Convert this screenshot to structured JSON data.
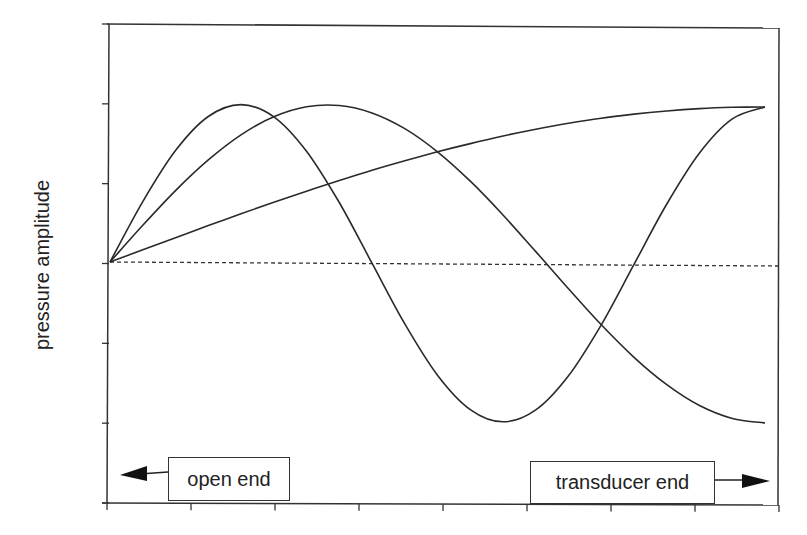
{
  "chart_data": {
    "type": "line",
    "title": "",
    "xlabel": "",
    "ylabel": "pressure amplitude",
    "xlim": [
      0,
      1
    ],
    "ylim": [
      -1.5,
      1.5
    ],
    "grid": false,
    "legend": null,
    "x_ticks_count": 9,
    "y_ticks_count": 7,
    "zero_line": {
      "y": 0,
      "style": "dotted"
    },
    "x": [
      0,
      0.05,
      0.1,
      0.15,
      0.2,
      0.25,
      0.3,
      0.35,
      0.4,
      0.45,
      0.5,
      0.55,
      0.6,
      0.65,
      0.7,
      0.75,
      0.8,
      0.85,
      0.9,
      0.95,
      1.0
    ],
    "series": [
      {
        "name": "quarter-wave mode",
        "values": [
          0,
          0.078,
          0.156,
          0.233,
          0.309,
          0.383,
          0.454,
          0.522,
          0.588,
          0.649,
          0.707,
          0.76,
          0.809,
          0.853,
          0.891,
          0.924,
          0.951,
          0.972,
          0.988,
          0.997,
          1.0
        ]
      },
      {
        "name": "three-quarter-wave mode",
        "values": [
          0,
          0.233,
          0.454,
          0.649,
          0.809,
          0.924,
          0.988,
          0.997,
          0.951,
          0.853,
          0.707,
          0.522,
          0.309,
          0.078,
          -0.156,
          -0.383,
          -0.588,
          -0.76,
          -0.891,
          -0.972,
          -1.0
        ]
      },
      {
        "name": "five-quarter-wave mode",
        "values": [
          0,
          0.383,
          0.707,
          0.924,
          1.0,
          0.924,
          0.707,
          0.383,
          0,
          -0.383,
          -0.707,
          -0.924,
          -1.0,
          -0.924,
          -0.707,
          -0.383,
          0,
          0.383,
          0.707,
          0.924,
          1.0
        ]
      }
    ],
    "annotations": [
      {
        "text": "open end",
        "arrow": "left",
        "position": "bottom-left"
      },
      {
        "text": "transducer end",
        "arrow": "right",
        "position": "bottom-right"
      }
    ]
  },
  "labels": {
    "ylabel": "pressure amplitude",
    "open_end": "open end",
    "transducer_end": "transducer end"
  }
}
